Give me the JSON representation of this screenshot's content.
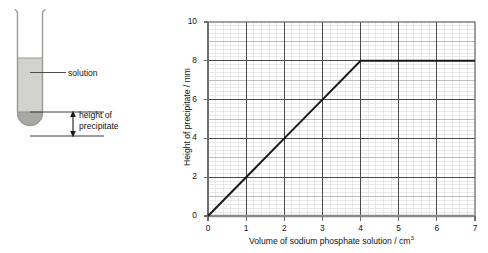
{
  "diagram": {
    "name": "test-tube-precipitate-diagram",
    "labels": {
      "solution": "solution",
      "height_of_precipitate_line1": "height of",
      "height_of_precipitate_line2": "precipitate"
    },
    "colors": {
      "solution_fill": "#d2d2ce",
      "precipitate_fill": "#a9a9a4",
      "tube_outline": "#9a9a96",
      "leader_line": "#4d4d4d"
    }
  },
  "chart_data": {
    "type": "line",
    "title": "",
    "xlabel": "Volume of sodium phosphate solution / cm³",
    "ylabel": "Height of precipitate / mm",
    "xlim": [
      0,
      7
    ],
    "ylim": [
      0,
      10
    ],
    "xticks": [
      0,
      1,
      2,
      3,
      4,
      5,
      6,
      7
    ],
    "yticks": [
      0,
      2,
      4,
      6,
      8,
      10
    ],
    "xtick_labels": [
      "0",
      "1",
      "2",
      "3",
      "4",
      "5",
      "6",
      "7"
    ],
    "ytick_labels": [
      "0",
      "2",
      "4",
      "6",
      "8",
      "10"
    ],
    "grid": true,
    "grid_minor_step_x": 0.2,
    "grid_minor_step_y": 0.2,
    "grid_major_step_x": 1,
    "grid_major_step_y": 2,
    "legend": null,
    "series": [
      {
        "name": "height of precipitate",
        "x": [
          0,
          1,
          2,
          3,
          4,
          5,
          6,
          7
        ],
        "y": [
          0,
          2,
          4,
          6,
          8,
          8,
          8,
          8
        ],
        "color": "#1a1a1a",
        "line_width": 2,
        "markers": false
      }
    ],
    "annotations": [
      {
        "text": "equivalence point / plateau begins",
        "x": 4,
        "y": 8,
        "visible": false
      }
    ],
    "colors": {
      "axis": "#6e6e6e",
      "grid_major": "#4a4a4a",
      "grid_medium": "#b6b6b6",
      "grid_minor": "#dcdcdc",
      "line": "#1a1a1a"
    }
  },
  "chart_labels": {
    "x_axis_title_main": "Volume of sodium phosphate solution / cm",
    "x_axis_title_sup": "3",
    "y_axis_title": "Height of precipitate / mm"
  }
}
